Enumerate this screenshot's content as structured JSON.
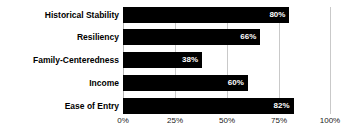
{
  "chart_data": {
    "type": "bar",
    "orientation": "horizontal",
    "title": "",
    "xlabel": "",
    "ylabel": "",
    "categories": [
      "Historical Stability",
      "Resiliency",
      "Family-Centeredness",
      "Income",
      "Ease of Entry"
    ],
    "values": [
      80,
      66,
      38,
      60,
      82
    ],
    "value_labels": [
      "80%",
      "66%",
      "38%",
      "60%",
      "82%"
    ],
    "xlim": [
      0,
      100
    ],
    "xticks": [
      0,
      25,
      50,
      75,
      100
    ],
    "xtick_labels": [
      "0%",
      "25%",
      "50%",
      "75%",
      "100%"
    ],
    "grid": true,
    "grid_axis": "x",
    "legend": false,
    "legend_position": "none",
    "bar_color": "#000000",
    "value_label_color": "#ffffff",
    "gridline_color": "#c9c9c9",
    "background_color": "#ffffff"
  }
}
